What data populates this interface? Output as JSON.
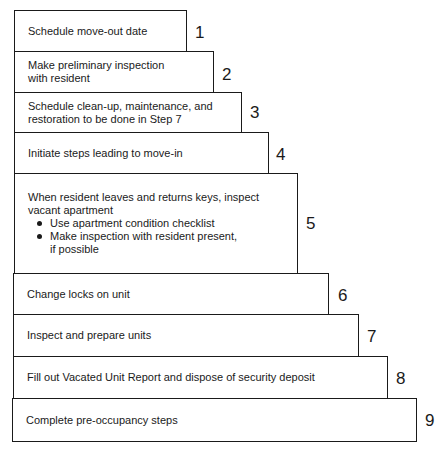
{
  "diagram": {
    "type": "staircase-process",
    "steps": [
      {
        "number": "1",
        "text": "Schedule move-out date"
      },
      {
        "number": "2",
        "text": "Make preliminary inspection\nwith resident"
      },
      {
        "number": "3",
        "text": "Schedule clean-up, maintenance, and\nrestoration to be done in Step 7"
      },
      {
        "number": "4",
        "text": "Initiate steps leading to move-in"
      },
      {
        "number": "5",
        "text": "When resident leaves and returns keys, inspect\nvacant apartment",
        "bullets": [
          "Use apartment condition checklist",
          "Make inspection with resident present,\nif possible"
        ]
      },
      {
        "number": "6",
        "text": "Change locks on unit"
      },
      {
        "number": "7",
        "text": "Inspect and prepare units"
      },
      {
        "number": "8",
        "text": "Fill out Vacated Unit Report and dispose of security deposit"
      },
      {
        "number": "9",
        "text": "Complete pre-occupancy steps"
      }
    ]
  }
}
